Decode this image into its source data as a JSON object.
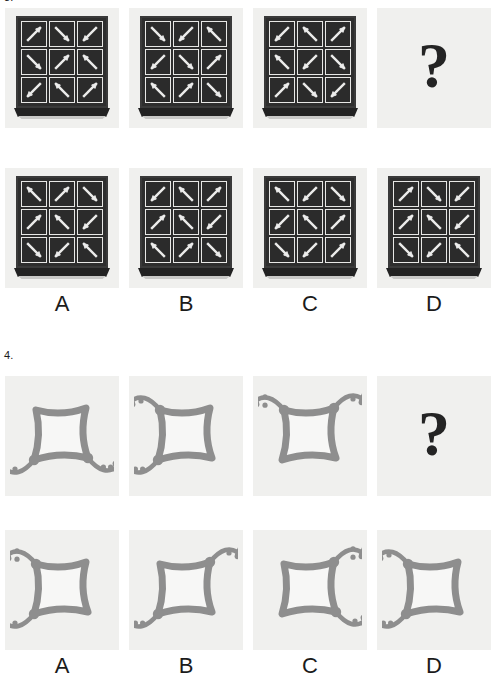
{
  "page": {
    "background": "#ffffff",
    "ink": "#1b1b1b",
    "arrow_tile_bg": "#f0f0ee",
    "arrow_grid_dark": "#2e2e2e",
    "arrow_color": "#ececeb",
    "blob_color": "#8e8e8e",
    "question_mark": "?"
  },
  "questions": [
    {
      "id": "question-3",
      "number": "3.",
      "type": "arrow-grid",
      "prompt_row": [
        {
          "name": "prompt-figure-1",
          "kind": "grid",
          "arrows": [
            [
              "NE",
              "SE",
              "SW"
            ],
            [
              "SE",
              "NE",
              "NW"
            ],
            [
              "SW",
              "NW",
              "NE"
            ]
          ]
        },
        {
          "name": "prompt-figure-2",
          "kind": "grid",
          "arrows": [
            [
              "SE",
              "SW",
              "NW"
            ],
            [
              "SW",
              "SE",
              "NE"
            ],
            [
              "NW",
              "NE",
              "SE"
            ]
          ]
        },
        {
          "name": "prompt-figure-3",
          "kind": "grid",
          "arrows": [
            [
              "SW",
              "NW",
              "NE"
            ],
            [
              "NW",
              "SW",
              "SE"
            ],
            [
              "NE",
              "SE",
              "SW"
            ]
          ]
        },
        {
          "name": "prompt-missing",
          "kind": "question-mark",
          "label": "?"
        }
      ],
      "options": [
        {
          "letter": "A",
          "arrows": [
            [
              "NW",
              "NE",
              "SE"
            ],
            [
              "NE",
              "NW",
              "SW"
            ],
            [
              "SE",
              "SW",
              "NW"
            ]
          ]
        },
        {
          "letter": "B",
          "arrows": [
            [
              "SW",
              "NW",
              "NE"
            ],
            [
              "NE",
              "NW",
              "SW"
            ],
            [
              "NW",
              "NE",
              "SE"
            ]
          ]
        },
        {
          "letter": "C",
          "arrows": [
            [
              "NW",
              "SW",
              "SE"
            ],
            [
              "SW",
              "NW",
              "NE"
            ],
            [
              "SE",
              "SW",
              "NE"
            ]
          ]
        },
        {
          "letter": "D",
          "arrows": [
            [
              "NE",
              "SE",
              "SW"
            ],
            [
              "NE",
              "NW",
              "SW"
            ],
            [
              "SE",
              "SW",
              "NW"
            ]
          ]
        }
      ]
    },
    {
      "id": "question-4",
      "number": "4.",
      "type": "blob-figure",
      "prompt_row": [
        {
          "name": "prompt-figure-1",
          "kind": "blob",
          "nodes": [
            {
              "corner": "bottom-left",
              "dots": 1
            },
            {
              "corner": "bottom-right",
              "dots": 2
            }
          ]
        },
        {
          "name": "prompt-figure-2",
          "kind": "blob",
          "nodes": [
            {
              "corner": "top-left",
              "dots": 1
            },
            {
              "corner": "bottom-left",
              "dots": 2
            }
          ]
        },
        {
          "name": "prompt-figure-3",
          "kind": "blob",
          "nodes": [
            {
              "corner": "top-left",
              "dots": 2
            },
            {
              "corner": "top-right",
              "dots": 1
            }
          ]
        },
        {
          "name": "prompt-missing",
          "kind": "question-mark",
          "label": "?"
        }
      ],
      "options": [
        {
          "letter": "A",
          "nodes": [
            {
              "corner": "top-left",
              "dots": 2
            },
            {
              "corner": "bottom-left",
              "dots": 1
            }
          ]
        },
        {
          "letter": "B",
          "nodes": [
            {
              "corner": "top-right",
              "dots": 1
            },
            {
              "corner": "bottom-left",
              "dots": 2
            }
          ]
        },
        {
          "letter": "C",
          "nodes": [
            {
              "corner": "top-right",
              "dots": 2
            },
            {
              "corner": "bottom-right",
              "dots": 1
            }
          ]
        },
        {
          "letter": "D",
          "nodes": [
            {
              "corner": "top-left",
              "dots": 1
            },
            {
              "corner": "bottom-left",
              "dots": 2
            }
          ]
        }
      ]
    }
  ]
}
